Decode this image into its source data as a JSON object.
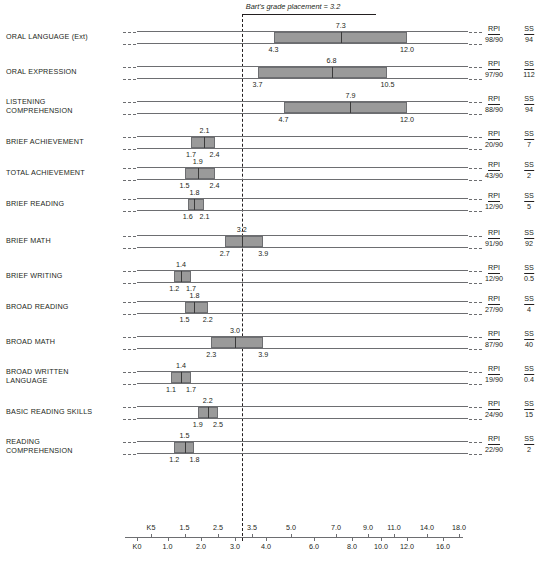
{
  "annotation": {
    "caption": "Bart's grade placement = 3.2",
    "value": 3.2
  },
  "score_columns": {
    "rpi_header": "RPI",
    "ss_header": "SS"
  },
  "axis": {
    "upper_ticks": [
      "K5",
      "1.5",
      "2.5",
      "3.5",
      "5.0",
      "7.0",
      "9.0",
      "11.0",
      "14.0",
      "18.0"
    ],
    "upper_values": [
      0.5,
      1.5,
      2.5,
      3.5,
      5.0,
      7.0,
      9.0,
      11.0,
      14.0,
      18.0
    ],
    "lower_ticks": [
      "K0",
      "1.0",
      "2.0",
      "3.0",
      "4.0",
      "6.0",
      "8.0",
      "10.0",
      "12.0",
      "16.0"
    ],
    "lower_values": [
      0.0,
      1.0,
      2.0,
      3.0,
      4.0,
      6.0,
      8.0,
      10.0,
      12.0,
      16.0
    ],
    "range": [
      -0.35,
      19.5
    ]
  },
  "chart_data": {
    "type": "bar",
    "xlabel": "Grade Equivalent",
    "ylabel": "",
    "grid": false,
    "legend": "none",
    "reference_line": {
      "label": "Bart's grade placement = 3.2",
      "value": 3.2
    },
    "rows": [
      {
        "label": "ORAL LANGUAGE (Ext)",
        "mid": 7.3,
        "lo": 4.3,
        "hi": 12.0,
        "mid_text": "7.3",
        "lo_text": "4.3",
        "hi_text": "12.0",
        "rpi": "98/90",
        "ss": "94"
      },
      {
        "label": "ORAL EXPRESSION",
        "mid": 6.8,
        "lo": 3.7,
        "hi": 10.5,
        "mid_text": "6.8",
        "lo_text": "3.7",
        "hi_text": "10.5",
        "rpi": "97/90",
        "ss": "112"
      },
      {
        "label": "LISTENING\nCOMPREHENSION",
        "mid": 7.9,
        "lo": 4.7,
        "hi": 12.0,
        "mid_text": "7.9",
        "lo_text": "4.7",
        "hi_text": "12.0",
        "rpi": "88/90",
        "ss": "94"
      },
      {
        "label": "BRIEF ACHIEVEMENT",
        "mid": 2.1,
        "lo": 1.7,
        "hi": 2.4,
        "mid_text": "2.1",
        "lo_text": "1.7",
        "hi_text": "2.4",
        "rpi": "20/90",
        "ss": "7"
      },
      {
        "label": "TOTAL ACHIEVEMENT",
        "mid": 1.9,
        "lo": 1.5,
        "hi": 2.4,
        "mid_text": "1.9",
        "lo_text": "1.5",
        "hi_text": "2.4",
        "rpi": "43/90",
        "ss": "2"
      },
      {
        "label": "BRIEF READING",
        "mid": 1.8,
        "lo": 1.6,
        "hi": 2.1,
        "mid_text": "1.8",
        "lo_text": "1.6",
        "hi_text": "2.1",
        "rpi": "12/90",
        "ss": "5"
      },
      {
        "label": "BRIEF MATH",
        "mid": 3.2,
        "lo": 2.7,
        "hi": 3.9,
        "mid_text": "3.2",
        "lo_text": "2.7",
        "hi_text": "3.9",
        "rpi": "91/90",
        "ss": "92"
      },
      {
        "label": "BRIEF WRITING",
        "mid": 1.4,
        "lo": 1.2,
        "hi": 1.7,
        "mid_text": "1.4",
        "lo_text": "1.2",
        "hi_text": "1.7",
        "rpi": "12/90",
        "ss": "0.5"
      },
      {
        "label": "BROAD READING",
        "mid": 1.8,
        "lo": 1.5,
        "hi": 2.2,
        "mid_text": "1.8",
        "lo_text": "1.5",
        "hi_text": "2.2",
        "rpi": "27/90",
        "ss": "4"
      },
      {
        "label": "BROAD MATH",
        "mid": 3.0,
        "lo": 2.3,
        "hi": 3.9,
        "mid_text": "3.0",
        "lo_text": "2.3",
        "hi_text": "3.9",
        "rpi": "87/90",
        "ss": "40"
      },
      {
        "label": "BROAD WRITTEN\nLANGUAGE",
        "mid": 1.4,
        "lo": 1.1,
        "hi": 1.7,
        "mid_text": "1.4",
        "lo_text": "1.1",
        "hi_text": "1.7",
        "rpi": "19/90",
        "ss": "0.4"
      },
      {
        "label": "BASIC READING SKILLS",
        "mid": 2.2,
        "lo": 1.9,
        "hi": 2.5,
        "mid_text": "2.2",
        "lo_text": "1.9",
        "hi_text": "2.5",
        "rpi": "24/90",
        "ss": "15"
      },
      {
        "label": "READING\nCOMPREHENSION",
        "mid": 1.5,
        "lo": 1.2,
        "hi": 1.8,
        "mid_text": "1.5",
        "lo_text": "1.2",
        "hi_text": "1.8",
        "rpi": "22/90",
        "ss": "2"
      }
    ]
  },
  "colors": {
    "box_fill": "#9a9a9a",
    "rule": "#6d6e71",
    "text": "#231f20"
  }
}
